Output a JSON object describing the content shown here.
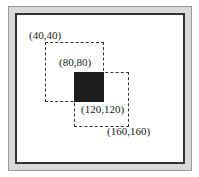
{
  "diagram": {
    "labels": {
      "p1": "(40,40)",
      "p2": "(80,80)",
      "p3": "(120,120)",
      "p4": "(160,160)"
    },
    "shapes": [
      {
        "name": "rect-a",
        "from": [
          40,
          40
        ],
        "to": [
          120,
          120
        ],
        "style": "dashed"
      },
      {
        "name": "rect-b",
        "from": [
          80,
          80
        ],
        "to": [
          160,
          160
        ],
        "style": "dashed"
      },
      {
        "name": "intersection",
        "from": [
          80,
          80
        ],
        "to": [
          120,
          120
        ],
        "style": "filled",
        "color": "#1e1e1e"
      }
    ]
  }
}
